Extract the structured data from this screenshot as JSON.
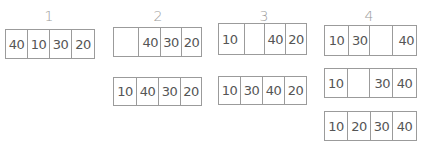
{
  "steps": [
    {
      "label": "1",
      "rows": [
        {
          "cells": [
            "40",
            "10",
            "30",
            "20"
          ]
        }
      ]
    },
    {
      "label": "2",
      "rows": [
        {
          "cells": [
            "",
            "40",
            "30",
            "20"
          ]
        },
        {
          "cells": [
            "10",
            "40",
            "30",
            "20"
          ]
        }
      ]
    },
    {
      "label": "3",
      "rows": [
        {
          "cells": [
            "10",
            "",
            "40",
            "20"
          ]
        },
        {
          "cells": [
            "10",
            "30",
            "40",
            "20"
          ]
        }
      ]
    },
    {
      "label": "4",
      "rows": [
        {
          "cells": [
            "10",
            "30",
            "",
            "40"
          ]
        },
        {
          "cells": [
            "10",
            "",
            "30",
            "40"
          ]
        },
        {
          "cells": [
            "10",
            "20",
            "30",
            "40"
          ]
        }
      ]
    }
  ]
}
